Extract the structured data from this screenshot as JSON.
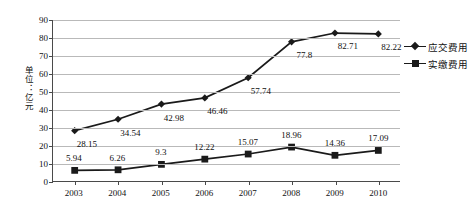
{
  "chart_data": {
    "type": "line",
    "title": "",
    "xlabel": "",
    "ylabel": "单位：亿元",
    "categories": [
      "2003",
      "2004",
      "2005",
      "2006",
      "2007",
      "2008",
      "2009",
      "2010"
    ],
    "ylim": [
      0,
      90
    ],
    "ytick_step": 10,
    "yticks": [
      "0",
      "10",
      "20",
      "30",
      "40",
      "50",
      "60",
      "70",
      "80",
      "90"
    ],
    "grid": true,
    "legend_position": "right",
    "series": [
      {
        "name": "应交费用",
        "marker": "diamond",
        "color": "#1a1a1a",
        "values": [
          28.15,
          34.54,
          42.98,
          46.46,
          57.74,
          77.8,
          82.71,
          82.22
        ],
        "labels": [
          "28.15",
          "34.54",
          "42.98",
          "46.46",
          "57.74",
          "77.8",
          "82.71",
          "82.22"
        ]
      },
      {
        "name": "实缴费用",
        "marker": "square",
        "color": "#1a1a1a",
        "values": [
          5.94,
          6.26,
          9.3,
          12.22,
          15.07,
          18.96,
          14.36,
          17.09
        ],
        "labels": [
          "5.94",
          "6.26",
          "9.3",
          "12.22",
          "15.07",
          "18.96",
          "14.36",
          "17.09"
        ]
      }
    ]
  }
}
